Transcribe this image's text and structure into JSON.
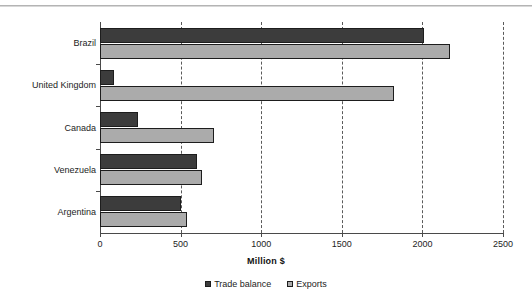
{
  "chart_data": {
    "type": "bar",
    "orientation": "horizontal",
    "title": "",
    "xlabel": "Million $",
    "ylabel": "",
    "xlim": [
      0,
      2500
    ],
    "xticks": [
      "0",
      "500",
      "1000",
      "1500",
      "2000",
      "2500"
    ],
    "xtick_values": [
      0,
      500,
      1000,
      1500,
      2000,
      2500
    ],
    "grid": "vertical-dashed",
    "legend_position": "bottom-center",
    "categories": [
      "Brazil",
      "United Kingdom",
      "Canada",
      "Venezuela",
      "Argentina"
    ],
    "series": [
      {
        "name": "Trade balance",
        "color": "#3c3c3c",
        "values": [
          2010,
          87,
          233,
          600,
          500
        ]
      },
      {
        "name": "Exports",
        "color": "#ababab",
        "values": [
          2170,
          1825,
          710,
          634,
          542
        ]
      }
    ]
  },
  "legend": {
    "items": [
      {
        "label": "Trade balance",
        "swatch": "trade"
      },
      {
        "label": "Exports",
        "swatch": "exports"
      }
    ]
  }
}
